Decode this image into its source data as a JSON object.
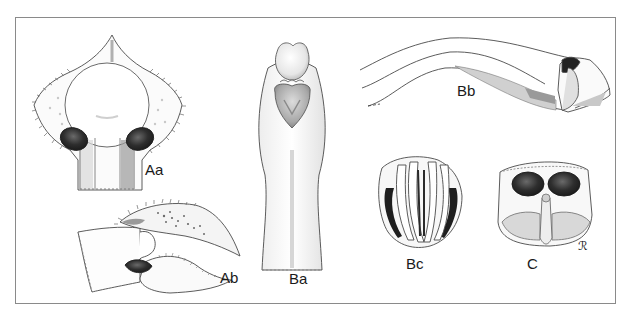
{
  "figure": {
    "panels": [
      {
        "id": "Aa",
        "label": "Aa",
        "description": "ventral view, rounded plate with two dark oval receptacles"
      },
      {
        "id": "Ab",
        "label": "Ab",
        "description": "lateral view, elongated spiny structure"
      },
      {
        "id": "Ba",
        "label": "Ba",
        "description": "elongated body with bulb and heart-shaped lobe at top"
      },
      {
        "id": "Bb",
        "label": "Bb",
        "description": "long curved duct with terminal apparatus"
      },
      {
        "id": "Bc",
        "label": "Bc",
        "description": "rounded structure with vertical lamellae"
      },
      {
        "id": "C",
        "label": "C",
        "description": "box-shaped structure with two dark oval spermathecae"
      }
    ],
    "signature": "ℛ",
    "colors": {
      "frame": "#8a8a8a",
      "ink": "#3a3a3a",
      "dark_fill": "#2b2b2b",
      "shade": "#b8b8b8",
      "background": "#ffffff"
    }
  }
}
